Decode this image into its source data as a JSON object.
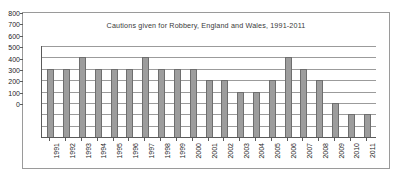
{
  "chart_data": {
    "type": "bar",
    "title": "Cautions given for Robbery, England and Wales, 1991-2011",
    "xlabel": "",
    "ylabel": "",
    "ylim": [
      0,
      800
    ],
    "ytick_step": 100,
    "yticks": [
      "800",
      "700",
      "600",
      "500",
      "400",
      "300",
      "200",
      "100",
      "0"
    ],
    "grid": true,
    "legend": "none",
    "bar_color": "#9d9d9d",
    "bar_border_color": "#6e6e6e",
    "categories": [
      "1991",
      "1992",
      "1993",
      "1994",
      "1995",
      "1996",
      "1997",
      "1998",
      "1999",
      "2000",
      "2001",
      "2002",
      "2003",
      "2004",
      "2005",
      "2006",
      "2007",
      "2008",
      "2009",
      "2010",
      "2011"
    ],
    "values": [
      600,
      600,
      700,
      600,
      600,
      600,
      700,
      600,
      600,
      600,
      500,
      500,
      400,
      400,
      500,
      700,
      600,
      500,
      300,
      200,
      200
    ]
  }
}
